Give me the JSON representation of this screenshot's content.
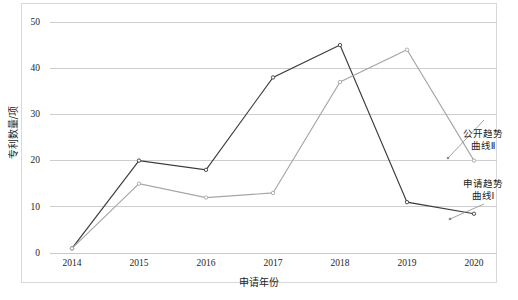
{
  "chart_data": {
    "type": "line",
    "title": "",
    "xlabel": "申请年份",
    "ylabel": "专利数量/项",
    "categories": [
      "2014",
      "2015",
      "2016",
      "2017",
      "2018",
      "2019",
      "2020"
    ],
    "x": [
      2014,
      2015,
      2016,
      2017,
      2018,
      2019,
      2020
    ],
    "ylim": [
      0,
      50
    ],
    "yticks": [
      0,
      10,
      20,
      30,
      40,
      50
    ],
    "ytick_labels": [
      "0",
      "10",
      "20",
      "30",
      "40",
      "50"
    ],
    "grid": true,
    "legend_position": "inline-annotation-right",
    "series": [
      {
        "name": "申请趋势曲线Ⅰ",
        "color": "#3a3a3a",
        "marker": "circle-open",
        "values": [
          1,
          20,
          18,
          38,
          45,
          11,
          8.5
        ]
      },
      {
        "name": "公开趋势曲线Ⅱ",
        "color": "#a6a6a6",
        "marker": "circle-open",
        "values": [
          1,
          15,
          12,
          13,
          37,
          44,
          20
        ]
      }
    ],
    "annotations": [
      {
        "name": "公开趋势曲线Ⅱ",
        "text": "公开趋势\n曲线Ⅱ",
        "points_to_series": "公开趋势曲线Ⅱ"
      },
      {
        "name": "申请趋势曲线Ⅰ",
        "text": "申请趋势\n曲线Ⅰ",
        "points_to_series": "申请趋势曲线Ⅰ"
      }
    ]
  },
  "axes": {
    "y_labels": [
      "50",
      "40",
      "30",
      "20",
      "10",
      "0"
    ],
    "x_labels": [
      "2014",
      "2015",
      "2016",
      "2017",
      "2018",
      "2019",
      "2020"
    ],
    "x_title": "申请年份",
    "y_title": "专利数量/项"
  },
  "annotations": {
    "disclosure": "公开趋势\n曲线Ⅱ",
    "application": "申请趋势\n曲线Ⅰ"
  },
  "colors": {
    "series_application": "#3a3a3a",
    "series_disclosure": "#a6a6a6",
    "grid": "#c9c9c9",
    "frame": "#d8d8d8",
    "text": "#1d1d1d",
    "background": "#ffffff"
  }
}
